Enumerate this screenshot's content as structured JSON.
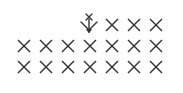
{
  "figure": {
    "symbol": "x-mark",
    "stroke_color": "#333333",
    "background": "#ffffff",
    "special_symbol": "x-over-chevron-with-down-arrow",
    "rows": [
      {
        "index": 0,
        "count": 3,
        "has_special_first": true
      },
      {
        "index": 1,
        "count": 7,
        "has_special_first": false
      },
      {
        "index": 2,
        "count": 7,
        "has_special_first": false
      }
    ]
  }
}
